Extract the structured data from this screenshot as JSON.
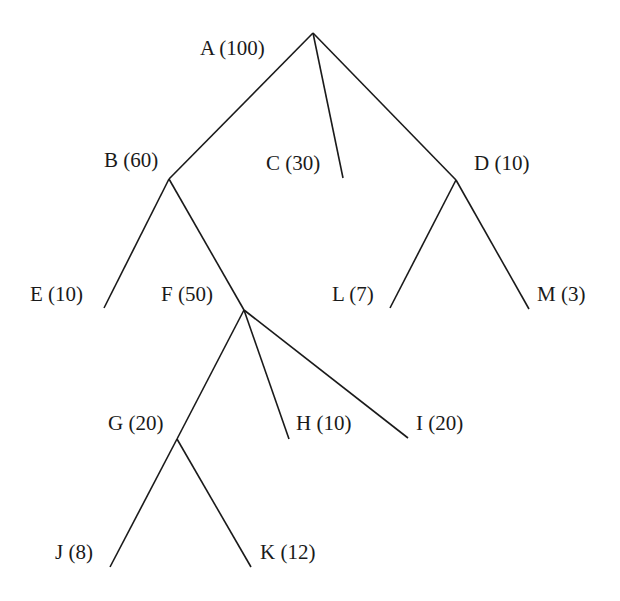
{
  "diagram": {
    "type": "tree",
    "nodes": [
      {
        "id": "A",
        "label": "A (100)",
        "value": 100,
        "x": 313,
        "y": 33,
        "lx": 200,
        "ly": 38
      },
      {
        "id": "B",
        "label": "B (60)",
        "value": 60,
        "x": 169,
        "y": 179,
        "lx": 104,
        "ly": 150
      },
      {
        "id": "C",
        "label": "C (30)",
        "value": 30,
        "x": 343,
        "y": 178,
        "lx": 266,
        "ly": 153
      },
      {
        "id": "D",
        "label": "D (10)",
        "value": 10,
        "x": 456,
        "y": 180,
        "lx": 474,
        "ly": 153
      },
      {
        "id": "E",
        "label": "E (10)",
        "value": 10,
        "x": 104,
        "y": 308,
        "lx": 30,
        "ly": 284
      },
      {
        "id": "F",
        "label": "F (50)",
        "value": 50,
        "x": 244,
        "y": 310,
        "lx": 161,
        "ly": 284
      },
      {
        "id": "L",
        "label": "L (7)",
        "value": 7,
        "x": 390,
        "y": 308,
        "lx": 332,
        "ly": 284
      },
      {
        "id": "M",
        "label": "M (3)",
        "value": 3,
        "x": 529,
        "y": 309,
        "lx": 537,
        "ly": 284
      },
      {
        "id": "G",
        "label": "G (20)",
        "value": 20,
        "x": 177,
        "y": 439,
        "lx": 108,
        "ly": 413
      },
      {
        "id": "H",
        "label": "H (10)",
        "value": 10,
        "x": 289,
        "y": 439,
        "lx": 296,
        "ly": 413
      },
      {
        "id": "I",
        "label": "I (20)",
        "value": 20,
        "x": 408,
        "y": 438,
        "lx": 416,
        "ly": 413
      },
      {
        "id": "J",
        "label": "J (8)",
        "value": 8,
        "x": 110,
        "y": 567,
        "lx": 55,
        "ly": 542
      },
      {
        "id": "K",
        "label": "K (12)",
        "value": 12,
        "x": 251,
        "y": 567,
        "lx": 260,
        "ly": 542
      }
    ],
    "edges": [
      [
        "A",
        "B"
      ],
      [
        "A",
        "C"
      ],
      [
        "A",
        "D"
      ],
      [
        "B",
        "E"
      ],
      [
        "B",
        "F"
      ],
      [
        "D",
        "L"
      ],
      [
        "D",
        "M"
      ],
      [
        "F",
        "G"
      ],
      [
        "F",
        "H"
      ],
      [
        "F",
        "I"
      ],
      [
        "G",
        "J"
      ],
      [
        "G",
        "K"
      ]
    ]
  }
}
